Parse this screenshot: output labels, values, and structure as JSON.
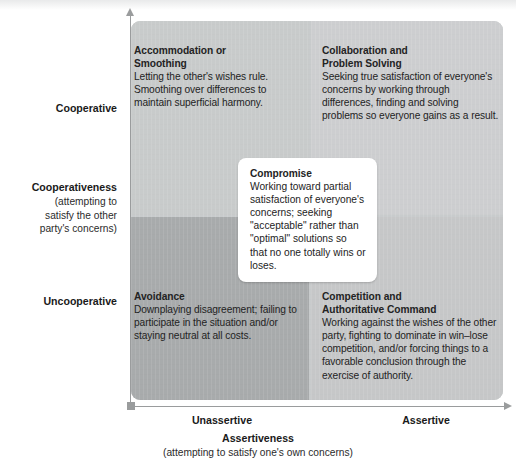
{
  "chart_data": {
    "type": "table",
    "xlabel": "Assertiveness",
    "xlabel_sub": "(attempting to satisfy one's own concerns)",
    "ylabel": "Cooperativeness",
    "ylabel_sub": "(attempting to satisfy the other party's concerns)",
    "x_ticks": [
      "Unassertive",
      "Assertive"
    ],
    "y_ticks": [
      "Cooperative",
      "Uncooperative"
    ],
    "grid": false,
    "legend": "none",
    "cells": [
      {
        "position": "top-left",
        "x": "Unassertive",
        "y": "Cooperative",
        "title": "Accommodation or Smoothing",
        "body": "Letting the other's wishes rule. Smoothing over differences to maintain superficial harmony.",
        "fill": "#c9cbcb"
      },
      {
        "position": "top-right",
        "x": "Assertive",
        "y": "Cooperative",
        "title": "Collaboration and Problem Solving",
        "body": "Seeking true satisfaction of everyone's concerns by working through differences, finding and solving problems so everyone gains as a result.",
        "fill": "#cdcfd0"
      },
      {
        "position": "bottom-left",
        "x": "Unassertive",
        "y": "Uncooperative",
        "title": "Avoidance",
        "body": "Downplaying disagreement; failing to participate in the situation and/or staying neutral at all costs.",
        "fill": "#a9abac"
      },
      {
        "position": "bottom-right",
        "x": "Assertive",
        "y": "Uncooperative",
        "title": "Competition and Authoritative Command",
        "body": "Working against the wishes of the other party, fighting to dominate in win–lose competition, and/or forcing things to a favorable conclusion through the exercise of authority.",
        "fill": "#c6c8c9"
      },
      {
        "position": "center",
        "x": "moderate",
        "y": "moderate",
        "title": "Compromise",
        "body": "Working toward partial satisfaction of everyone's concerns; seeking \"acceptable\" rather than \"optimal\" solutions so that no one totally wins or loses.",
        "fill": "#ffffff"
      }
    ]
  },
  "quadrants": {
    "top_left": {
      "title_line1": "Accommodation or",
      "title_line2": "Smoothing",
      "body": "Letting the other's wishes rule. Smoothing over differences to maintain superficial harmony."
    },
    "top_right": {
      "title_line1": "Collaboration and",
      "title_line2": "Problem Solving",
      "body": "Seeking true satisfaction of everyone's concerns by working through differences, finding and solving problems so everyone gains as a result."
    },
    "bottom_left": {
      "title_line1": "Avoidance",
      "title_line2": "",
      "body": "Downplaying disagreement; failing to participate in the situation and/or staying neutral at all costs."
    },
    "bottom_right": {
      "title_line1": "Competition and",
      "title_line2": "Authoritative Command",
      "body": "Working against the wishes of the other party, fighting to dominate in win–lose competition, and/or forcing things to a favorable conclusion through the exercise of authority."
    },
    "center": {
      "title_line1": "Compromise",
      "body": "Working toward partial satisfaction of everyone's concerns; seeking \"acceptable\" rather than \"optimal\" solutions so that no one totally wins or loses."
    }
  },
  "axes": {
    "y": {
      "high_label": "Cooperative",
      "low_label": "Uncooperative",
      "title": "Cooperativeness",
      "subtitle_line1": "(attempting to",
      "subtitle_line2": "satisfy the other",
      "subtitle_line3": "party's concerns)"
    },
    "x": {
      "low_label": "Unassertive",
      "high_label": "Assertive",
      "title": "Assertiveness",
      "subtitle": "(attempting to satisfy one's own concerns)"
    }
  },
  "colors": {
    "quad_top_left": "#c9cbcb",
    "quad_top_right": "#cdcfd0",
    "quad_bottom_left": "#a9abac",
    "quad_bottom_right": "#c6c8c9",
    "callout_bg": "#ffffff",
    "axis": "#9a9c9d",
    "text": "#232323"
  }
}
